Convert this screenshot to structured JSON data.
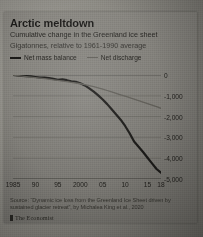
{
  "header": {
    "title": "Arctic meltdown",
    "subtitle_line1": "Cumulative change in the Greenland ice sheet",
    "subtitle_line2": "Gigatonnes, relative to 1961-1990 average"
  },
  "legend": {
    "items": [
      {
        "label": "Net mass balance",
        "color": "#1b1a18"
      },
      {
        "label": "Net discharge",
        "color": "#5f5d57"
      }
    ]
  },
  "footer": {
    "source": "Source: “Dynamic ice loss from the Greenland Ice Sheet driven by sustained glacier retreat”, by Michalea King et al., 2020",
    "logo_text": "The Economist"
  },
  "chart_data": {
    "type": "line",
    "title": "Arctic meltdown",
    "subtitle": "Cumulative change in the Greenland ice sheet",
    "xlabel": "",
    "ylabel": "Gigatonnes, relative to 1961-1990 average",
    "xlim": [
      1985,
      2018
    ],
    "ylim": [
      -5000,
      0
    ],
    "grid": true,
    "y_axis_position": "right",
    "legend_position": "top-left",
    "xticks": [
      1985,
      1990,
      1995,
      2000,
      2005,
      2010,
      2015,
      2018
    ],
    "xticklabels": [
      "1985",
      "90",
      "95",
      "2000",
      "05",
      "10",
      "15",
      "18"
    ],
    "yticks": [
      0,
      -1000,
      -2000,
      -3000,
      -4000,
      -5000
    ],
    "yticklabels": [
      "0",
      "-1,000",
      "-2,000",
      "-3,000",
      "-4,000",
      "-5,000"
    ],
    "x": [
      1985,
      1986,
      1987,
      1988,
      1989,
      1990,
      1991,
      1992,
      1993,
      1994,
      1995,
      1996,
      1997,
      1998,
      1999,
      2000,
      2001,
      2002,
      2003,
      2004,
      2005,
      2006,
      2007,
      2008,
      2009,
      2010,
      2011,
      2012,
      2013,
      2014,
      2015,
      2016,
      2017,
      2018
    ],
    "series": [
      {
        "name": "Net mass balance",
        "color": "#1b1a18",
        "width": 2.2,
        "values": [
          0,
          -20,
          -40,
          -55,
          -70,
          -95,
          -120,
          -130,
          -150,
          -190,
          -230,
          -210,
          -250,
          -300,
          -330,
          -400,
          -500,
          -640,
          -800,
          -980,
          -1180,
          -1400,
          -1650,
          -1900,
          -2150,
          -2450,
          -2800,
          -3200,
          -3450,
          -3700,
          -3980,
          -4250,
          -4520,
          -4700
        ]
      },
      {
        "name": "Net discharge",
        "color": "#5f5d57",
        "width": 1.3,
        "values": [
          0,
          -25,
          -50,
          -75,
          -100,
          -125,
          -150,
          -175,
          -200,
          -230,
          -260,
          -290,
          -320,
          -350,
          -385,
          -420,
          -460,
          -510,
          -560,
          -620,
          -680,
          -745,
          -810,
          -880,
          -950,
          -1020,
          -1090,
          -1160,
          -1230,
          -1300,
          -1375,
          -1450,
          -1525,
          -1600
        ]
      }
    ]
  }
}
